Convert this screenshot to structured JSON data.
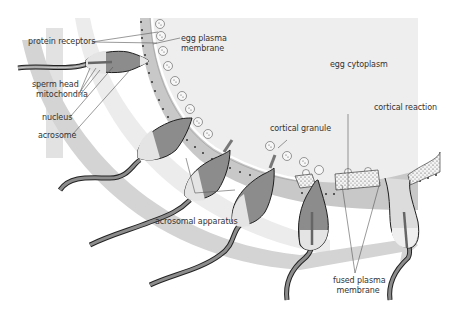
{
  "diagram": {
    "labels": {
      "protein_receptors": "protein receptors",
      "egg_plasma_membrane_1": "egg plasma",
      "egg_plasma_membrane_2": "membrane",
      "egg_cytoplasm": "egg cytoplasm",
      "sperm_head": "sperm head",
      "mitochondria": "mitochondria",
      "nucleus": "nucleus",
      "acrosome": "acrosome",
      "cortical_granule": "cortical granule",
      "cortical_reaction": "cortical reaction",
      "acrosomal_apparatus": "acrosomal apparatus",
      "fused_plasma_membrane_1": "fused plasma",
      "fused_plasma_membrane_2": "membrane"
    },
    "colors": {
      "cytoplasm": "#eeeeee",
      "zona": "#c9c9c9",
      "arrow": "#d6d6d6",
      "sperm_body": "#8c8c8c",
      "sperm_light": "#e6e6e6",
      "outline": "#1e1e1e",
      "text": "#333333"
    }
  }
}
